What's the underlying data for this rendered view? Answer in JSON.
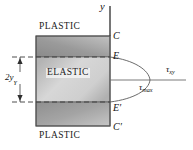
{
  "figure": {
    "zones": {
      "plastic_top": "PLASTIC",
      "elastic_core": "ELASTIC",
      "plastic_bottom": "PLASTIC"
    },
    "axis": {
      "y_label": "y",
      "tau_axis_label": "τ",
      "tau_axis_sub": "xy"
    },
    "points": [
      {
        "name": "point-c",
        "label": "C"
      },
      {
        "name": "point-e",
        "label": "E"
      },
      {
        "name": "point-e-prime",
        "label": "E′"
      },
      {
        "name": "point-c-prime",
        "label": "C′"
      }
    ],
    "annotations": {
      "tau_max": "τ",
      "tau_max_sub": "max",
      "dimension": "2y",
      "dimension_sub": "Y"
    },
    "colors": {
      "plastic_fill_dark": "#7e7e7e",
      "plastic_fill_light": "#b9b9b9",
      "elastic_fill_dark": "#a9a9a9",
      "elastic_fill_light": "#e2e2e2",
      "stroke": "#4a4a4a",
      "text": "#1a1a1a",
      "curve": "#555555"
    }
  }
}
